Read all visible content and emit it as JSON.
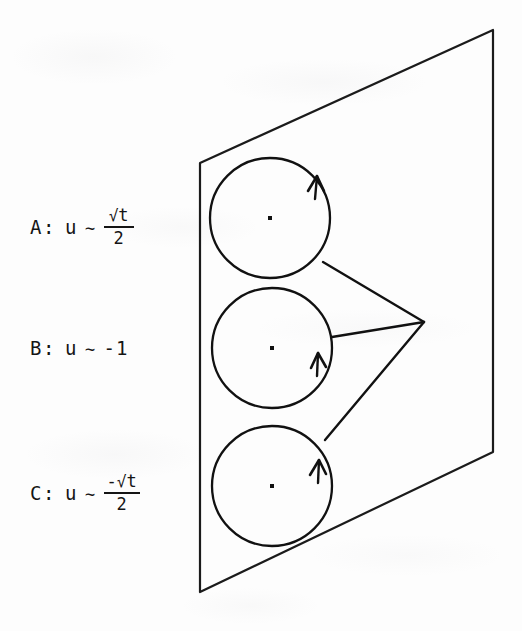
{
  "figure": {
    "background_color": "#fdfdfd",
    "ink_color": "#151515",
    "plane": {
      "name": "parallelogram-plane",
      "points": "200,163 493,30 493,452 200,592"
    },
    "vertex": {
      "x": 424,
      "y": 322
    },
    "circles": [
      {
        "id": "A",
        "cx": 270,
        "cy": 218,
        "r": 60,
        "arrow_angle_deg": -42,
        "connector_start": "323,262"
      },
      {
        "id": "B",
        "cx": 272,
        "cy": 348,
        "r": 60,
        "arrow_angle_deg": -2,
        "connector_start": "332,347"
      },
      {
        "id": "C",
        "cx": 272,
        "cy": 486,
        "r": 60,
        "arrow_angle_deg": -38,
        "connector_start": "325,440"
      }
    ],
    "center_dot_size": 4
  },
  "labels": [
    {
      "id": "A",
      "key": "A:",
      "variable": "u",
      "relation": "∼",
      "value_type": "fraction",
      "numerator_sign": "",
      "numerator_radical": "√",
      "numerator_radicand": "t",
      "denominator": "2",
      "plain_value": ""
    },
    {
      "id": "B",
      "key": "B:",
      "variable": "u",
      "relation": "∼",
      "value_type": "plain",
      "numerator_sign": "",
      "numerator_radical": "",
      "numerator_radicand": "",
      "denominator": "",
      "plain_value": "-1"
    },
    {
      "id": "C",
      "key": "C:",
      "variable": "u",
      "relation": "∼",
      "value_type": "fraction",
      "numerator_sign": "-",
      "numerator_radical": "√",
      "numerator_radicand": "t",
      "denominator": "2",
      "plain_value": ""
    }
  ]
}
